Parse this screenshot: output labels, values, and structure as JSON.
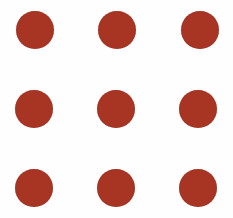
{
  "diagram": {
    "type": "dot-grid",
    "rows": 3,
    "columns": 3,
    "background_color": "#fefefe",
    "dot_color": "#a83524",
    "dot_radius": 19,
    "dots": [
      {
        "row": 0,
        "col": 0,
        "cx": 35,
        "cy": 30
      },
      {
        "row": 0,
        "col": 1,
        "cx": 117,
        "cy": 30
      },
      {
        "row": 0,
        "col": 2,
        "cx": 200,
        "cy": 30
      },
      {
        "row": 1,
        "col": 0,
        "cx": 34,
        "cy": 109
      },
      {
        "row": 1,
        "col": 1,
        "cx": 116,
        "cy": 109
      },
      {
        "row": 1,
        "col": 2,
        "cx": 198,
        "cy": 109
      },
      {
        "row": 2,
        "col": 0,
        "cx": 34,
        "cy": 188
      },
      {
        "row": 2,
        "col": 1,
        "cx": 116,
        "cy": 188
      },
      {
        "row": 2,
        "col": 2,
        "cx": 198,
        "cy": 188
      }
    ]
  }
}
